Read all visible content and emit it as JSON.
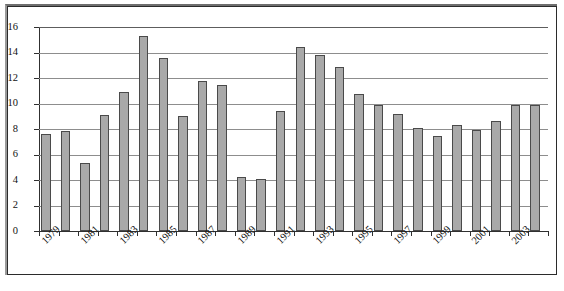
{
  "chart_data": {
    "type": "bar",
    "title": "",
    "subtitle": "",
    "xlabel": "",
    "ylabel": "",
    "ylim": [
      0,
      16
    ],
    "ytick_step": 2,
    "ytick_labels": [
      "16",
      "14",
      "12",
      "10",
      "8",
      "6",
      "4",
      "2",
      "0"
    ],
    "ytick_values": [
      16,
      14,
      12,
      10,
      8,
      6,
      4,
      2,
      0
    ],
    "grid": true,
    "grid_axis": "y",
    "legend": false,
    "legend_position": "none",
    "bar_color": "#a9a9a9",
    "bar_border_color": "#4a4a4a",
    "axis_color": "#303030",
    "gridline_color": "#8d8d8d",
    "categories": [
      "1979",
      "1980",
      "1981",
      "1982",
      "1983",
      "1984",
      "1985",
      "1986",
      "1987",
      "1988",
      "1989",
      "1990",
      "1991",
      "1992",
      "1993",
      "1994",
      "1995",
      "1996",
      "1997",
      "1998",
      "1999",
      "2000",
      "2001",
      "2002",
      "2003",
      "2004"
    ],
    "visible_tick_labels": [
      "1979",
      "1981",
      "1983",
      "1985",
      "1987",
      "1989",
      "1991",
      "1993",
      "1995",
      "1997",
      "1999",
      "2001",
      "2003"
    ],
    "values": [
      7.6,
      7.85,
      5.35,
      9.1,
      10.9,
      15.3,
      13.6,
      9.0,
      11.8,
      11.45,
      4.25,
      4.05,
      9.4,
      14.45,
      13.8,
      12.9,
      10.75,
      9.9,
      9.2,
      8.1,
      7.45,
      8.35,
      7.9,
      8.6,
      9.9,
      9.9
    ],
    "series": [
      {
        "name": "series-1",
        "values": [
          7.6,
          7.85,
          5.35,
          9.1,
          10.9,
          15.3,
          13.6,
          9.0,
          11.8,
          11.45,
          4.25,
          4.05,
          9.4,
          14.45,
          13.8,
          12.9,
          10.75,
          9.9,
          9.2,
          8.1,
          7.45,
          8.35,
          7.9,
          8.6,
          9.9,
          9.9
        ]
      }
    ]
  }
}
